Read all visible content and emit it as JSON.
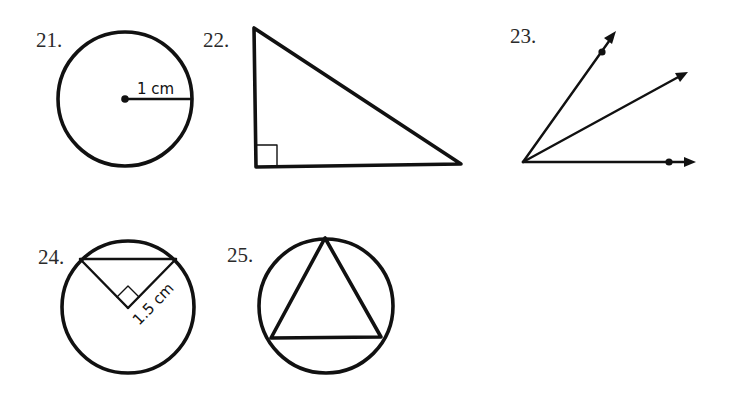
{
  "problems": [
    {
      "number": "21.",
      "shape": "circle",
      "description": "Circle with radius drawn from center",
      "label": "1 cm",
      "circle": {
        "cx": 125,
        "cy": 99,
        "r": 67
      },
      "radius_end": {
        "x": 192,
        "y": 99
      }
    },
    {
      "number": "22.",
      "shape": "right-triangle",
      "description": "Right triangle with right angle at bottom-left",
      "vertices": [
        {
          "x": 254,
          "y": 28
        },
        {
          "x": 256,
          "y": 167
        },
        {
          "x": 461,
          "y": 164
        }
      ]
    },
    {
      "number": "23.",
      "shape": "angles",
      "description": "Three rays from a common vertex; outer rays marked with points",
      "vertex": {
        "x": 523,
        "y": 162
      },
      "rays": [
        {
          "end": {
            "x": 616,
            "y": 31
          },
          "dot": {
            "x": 602,
            "y": 52
          }
        },
        {
          "end": {
            "x": 688,
            "y": 72
          },
          "dot": null
        },
        {
          "end": {
            "x": 695,
            "y": 162
          },
          "dot": {
            "x": 669,
            "y": 162
          }
        }
      ]
    },
    {
      "number": "24.",
      "shape": "circle-with-inscribed-right-triangle",
      "description": "Circle with chord and two radii forming a right angle at center",
      "label": "1.5 cm",
      "circle": {
        "cx": 128,
        "cy": 307,
        "r": 66
      },
      "chord": [
        {
          "x": 80,
          "y": 259
        },
        {
          "x": 176,
          "y": 259
        }
      ],
      "center_vertex": {
        "x": 128,
        "y": 308
      }
    },
    {
      "number": "25.",
      "shape": "circle-with-inscribed-triangle",
      "description": "Equilateral triangle inscribed in a circle",
      "circle": {
        "cx": 326,
        "cy": 306,
        "r": 67
      },
      "vertices": [
        {
          "x": 325,
          "y": 238
        },
        {
          "x": 271,
          "y": 338
        },
        {
          "x": 381,
          "y": 337
        }
      ]
    }
  ]
}
